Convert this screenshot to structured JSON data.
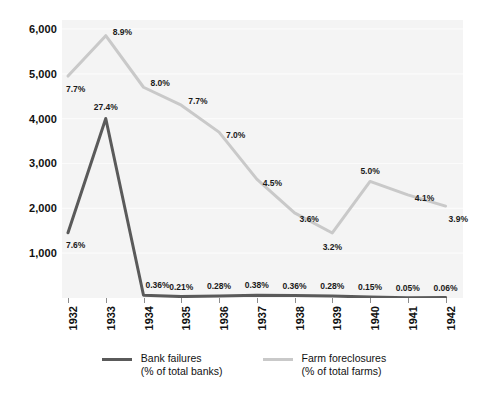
{
  "chart_data": {
    "type": "line",
    "title": "",
    "subtitle": "",
    "xlabel": "",
    "ylabel": "",
    "categories": [
      "1932",
      "1933",
      "1934",
      "1935",
      "1936",
      "1937",
      "1938",
      "1939",
      "1940",
      "1941",
      "1942"
    ],
    "ylim": [
      0,
      6200
    ],
    "yticks": [
      1000,
      2000,
      3000,
      4000,
      5000,
      6000
    ],
    "ytick_labels": [
      "1,000",
      "2,000",
      "3,000",
      "4,000",
      "5,000",
      "6,000"
    ],
    "grid": true,
    "legend_position": "bottom",
    "series": [
      {
        "name": "Bank failures",
        "sublabel": "(% of total banks)",
        "color": "#5a5a5a",
        "values": [
          1456,
          4004,
          61,
          32,
          44,
          59,
          54,
          42,
          22,
          7,
          9
        ],
        "point_labels": [
          "7.6%",
          "27.4%",
          "0.36%",
          "0.21%",
          "0.28%",
          "0.38%",
          "0.36%",
          "0.28%",
          "0.15%",
          "0.05%",
          "0.06%"
        ]
      },
      {
        "name": "Farm foreclosures",
        "sublabel": "(% of total farms)",
        "color": "#c9c9c9",
        "values": [
          4950,
          5850,
          4700,
          4300,
          3700,
          2650,
          1900,
          1450,
          2600,
          2300,
          2050
        ],
        "point_labels": [
          "7.7%",
          "8.9%",
          "8.0%",
          "7.7%",
          "7.0%",
          "4.5%",
          "3.6%",
          "3.2%",
          "5.0%",
          "4.1%",
          "3.9%"
        ]
      }
    ]
  },
  "legend": {
    "items": [
      {
        "name": "Bank failures",
        "sublabel": "(% of total banks)",
        "color": "#5a5a5a"
      },
      {
        "name": "Farm foreclosures",
        "sublabel": "(% of total farms)",
        "color": "#c9c9c9"
      }
    ]
  }
}
